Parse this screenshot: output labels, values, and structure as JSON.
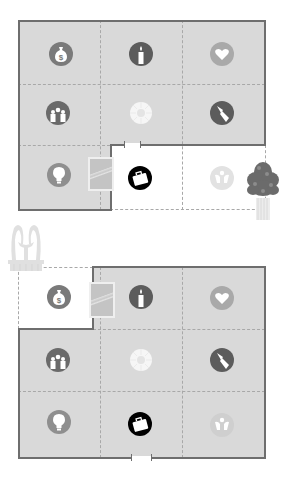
{
  "diagram": {
    "title": "",
    "colors": {
      "room_fill": "#d9d9d9",
      "missing_area_fill": "#ffffff",
      "wall": "#6e6e6e",
      "grid_dash": "#a8a8a8",
      "icon_dark": "#5c5c5c",
      "icon_mid": "#8f8f8f",
      "icon_light": "#a9a9a9",
      "icon_black": "#000000"
    },
    "plans": [
      {
        "id": "plan-top",
        "description": "Floor plan with missing lower-right area (career/helpful people corner) outside the wall",
        "grid": [
          [
            "wealth",
            "fame",
            "love"
          ],
          [
            "family",
            "health",
            "children"
          ],
          [
            "knowledge",
            "career",
            "helpful-people"
          ]
        ],
        "missing_cells": [
          "career",
          "helpful-people"
        ],
        "decorations": [
          "mirror",
          "plant",
          "door"
        ]
      },
      {
        "id": "plan-bottom",
        "description": "Floor plan with missing upper-left area (wealth corner) outside the wall",
        "grid": [
          [
            "wealth",
            "fame",
            "love"
          ],
          [
            "family",
            "health",
            "children"
          ],
          [
            "knowledge",
            "career",
            "helpful-people"
          ]
        ],
        "missing_cells": [
          "wealth"
        ],
        "decorations": [
          "mirror",
          "fountain",
          "door"
        ]
      }
    ],
    "icons": {
      "wealth": "money-bag-icon",
      "fame": "candle-icon",
      "love": "heart-icon",
      "family": "family-icon",
      "health": "sun-icon",
      "children": "paintbrush-icon",
      "knowledge": "lightbulb-icon",
      "career": "briefcase-icon",
      "helpful-people": "angel-icon"
    }
  }
}
